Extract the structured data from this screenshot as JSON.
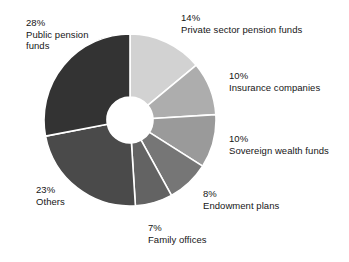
{
  "chart_data": {
    "type": "pie",
    "variant": "donut",
    "title": "",
    "subtitle": "",
    "xlabel": "",
    "ylabel": "",
    "legend_position": "outside-callout-labels",
    "grid": false,
    "units": "percent",
    "start_angle_deg": 0,
    "direction": "clockwise",
    "categories": [
      "Private sector pension funds",
      "Insurance companies",
      "Sovereign wealth funds",
      "Endowment plans",
      "Family offices",
      "Others",
      "Public pension funds"
    ],
    "values": [
      14,
      10,
      10,
      8,
      7,
      23,
      28
    ],
    "value_labels": [
      "14%",
      "10%",
      "10%",
      "8%",
      "7%",
      "23%",
      "28%"
    ],
    "colors": [
      "#d2d2d2",
      "#adadad",
      "#9a9a9a",
      "#767676",
      "#636363",
      "#4a4a4a",
      "#333333"
    ],
    "slices": [
      {
        "label": "Private sector pension funds",
        "value": 14,
        "value_label": "14%",
        "color": "#d2d2d2"
      },
      {
        "label": "Insurance companies",
        "value": 10,
        "value_label": "10%",
        "color": "#adadad"
      },
      {
        "label": "Sovereign wealth funds",
        "value": 10,
        "value_label": "10%",
        "color": "#9a9a9a"
      },
      {
        "label": "Endowment plans",
        "value": 8,
        "value_label": "8%",
        "color": "#767676"
      },
      {
        "label": "Family offices",
        "value": 7,
        "value_label": "7%",
        "color": "#636363"
      },
      {
        "label": "Others",
        "value": 23,
        "value_label": "23%",
        "color": "#4a4a4a"
      },
      {
        "label": "Public pension funds",
        "value": 28,
        "value_label": "28%",
        "color": "#333333"
      }
    ],
    "separator_color": "#ffffff",
    "background_color": "#ffffff"
  },
  "labels": {
    "public_pension": {
      "pct": "28%",
      "cat": "Public pension funds"
    },
    "private_pension": {
      "pct": "14%",
      "cat": "Private sector pension funds"
    },
    "insurance": {
      "pct": "10%",
      "cat": "Insurance companies"
    },
    "sovereign": {
      "pct": "10%",
      "cat": "Sovereign wealth funds"
    },
    "endowment": {
      "pct": "8%",
      "cat": "Endowment plans"
    },
    "family": {
      "pct": "7%",
      "cat": "Family offices"
    },
    "others": {
      "pct": "23%",
      "cat": "Others"
    }
  }
}
